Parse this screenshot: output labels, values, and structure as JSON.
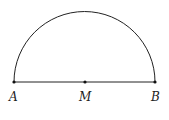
{
  "diagram": {
    "type": "semicircle",
    "stroke_color": "#222222",
    "points": [
      {
        "id": "A",
        "label": "A",
        "x": 14,
        "y": 82
      },
      {
        "id": "M",
        "label": "M",
        "x": 85,
        "y": 82
      },
      {
        "id": "B",
        "label": "B",
        "x": 155,
        "y": 82
      }
    ],
    "segments": [
      {
        "from": "A",
        "to": "B"
      }
    ],
    "arc": {
      "center": "M",
      "radius": 70.5,
      "from": "A",
      "to": "B",
      "side": "upper"
    }
  }
}
